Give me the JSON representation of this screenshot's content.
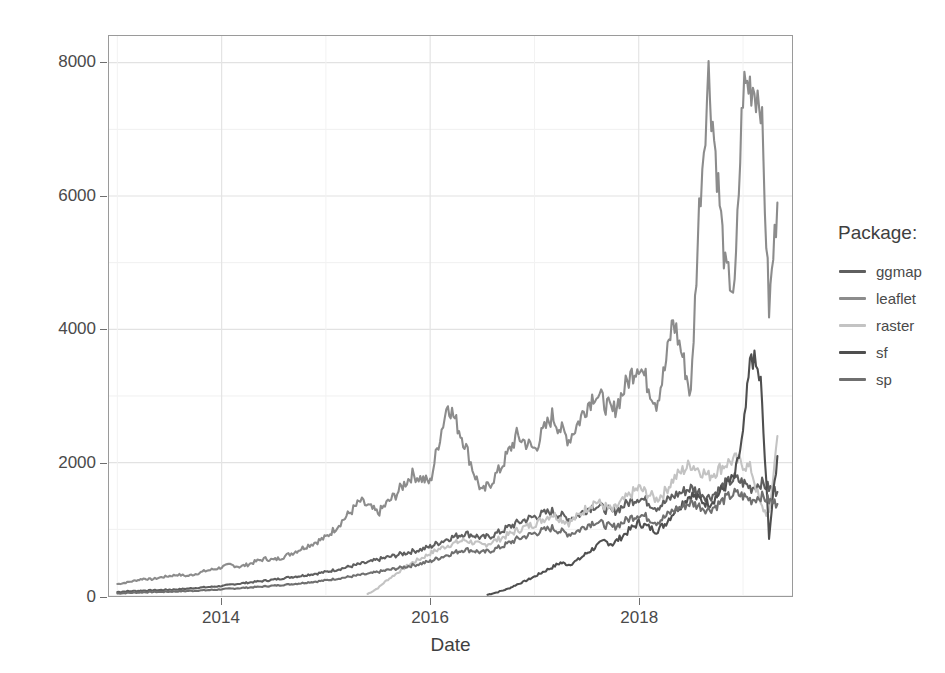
{
  "chart_data": {
    "type": "line",
    "title": "",
    "xlabel": "Date",
    "ylabel": "Downloads",
    "xlim": [
      2012.92,
      2019.47
    ],
    "ylim": [
      0,
      8400
    ],
    "yticks": [
      0,
      2000,
      4000,
      6000,
      8000
    ],
    "ytick_labels": [
      "0",
      "2000",
      "4000",
      "6000",
      "8000"
    ],
    "xticks": [
      2014,
      2016,
      2018
    ],
    "xtick_labels": [
      "2014",
      "2016",
      "2018"
    ],
    "grid": "major and minor, light gray",
    "legend_position": "right",
    "legend_title": "Package:",
    "series": [
      {
        "name": "ggmap",
        "color": "#5f5f5f",
        "x": [
          2013.0,
          2013.08,
          2013.17,
          2013.25,
          2013.33,
          2013.42,
          2013.5,
          2013.58,
          2013.67,
          2013.75,
          2013.83,
          2013.92,
          2014.0,
          2014.08,
          2014.17,
          2014.25,
          2014.33,
          2014.42,
          2014.5,
          2014.58,
          2014.67,
          2014.75,
          2014.83,
          2014.92,
          2015.0,
          2015.08,
          2015.17,
          2015.25,
          2015.33,
          2015.42,
          2015.5,
          2015.58,
          2015.67,
          2015.75,
          2015.83,
          2015.92,
          2016.0,
          2016.08,
          2016.17,
          2016.25,
          2016.33,
          2016.42,
          2016.5,
          2016.58,
          2016.67,
          2016.75,
          2016.83,
          2016.92,
          2017.0,
          2017.08,
          2017.17,
          2017.25,
          2017.33,
          2017.42,
          2017.5,
          2017.58,
          2017.67,
          2017.75,
          2017.83,
          2017.92,
          2018.0,
          2018.08,
          2018.17,
          2018.25,
          2018.33,
          2018.42,
          2018.5,
          2018.58,
          2018.67,
          2018.75,
          2018.83,
          2018.92,
          2019.0,
          2019.08,
          2019.17,
          2019.25,
          2019.33
        ],
        "y": [
          60,
          70,
          75,
          80,
          85,
          90,
          95,
          100,
          110,
          120,
          130,
          140,
          150,
          170,
          185,
          200,
          215,
          230,
          245,
          265,
          285,
          300,
          320,
          340,
          360,
          390,
          420,
          450,
          480,
          510,
          545,
          575,
          610,
          640,
          670,
          700,
          740,
          800,
          860,
          900,
          940,
          910,
          870,
          900,
          960,
          1030,
          1090,
          1150,
          1190,
          1230,
          1270,
          1210,
          1160,
          1210,
          1300,
          1360,
          1310,
          1260,
          1330,
          1420,
          1480,
          1420,
          1330,
          1400,
          1500,
          1560,
          1620,
          1560,
          1480,
          1560,
          1680,
          1760,
          1700,
          1620,
          1700,
          1620,
          1560
        ]
      },
      {
        "name": "leaflet",
        "color": "#8c8c8c",
        "x": [
          2013.0,
          2013.08,
          2013.17,
          2013.25,
          2013.33,
          2013.42,
          2013.5,
          2013.58,
          2013.67,
          2013.75,
          2013.83,
          2013.92,
          2014.0,
          2014.08,
          2014.17,
          2014.25,
          2014.33,
          2014.42,
          2014.5,
          2014.58,
          2014.67,
          2014.75,
          2014.83,
          2014.92,
          2015.0,
          2015.08,
          2015.17,
          2015.25,
          2015.33,
          2015.42,
          2015.5,
          2015.58,
          2015.67,
          2015.75,
          2015.83,
          2015.92,
          2016.0,
          2016.08,
          2016.17,
          2016.25,
          2016.33,
          2016.42,
          2016.5,
          2016.58,
          2016.67,
          2016.75,
          2016.83,
          2016.92,
          2017.0,
          2017.08,
          2017.17,
          2017.25,
          2017.33,
          2017.42,
          2017.5,
          2017.58,
          2017.67,
          2017.75,
          2017.83,
          2017.92,
          2018.0,
          2018.08,
          2018.17,
          2018.25,
          2018.33,
          2018.42,
          2018.5,
          2018.58,
          2018.67,
          2018.75,
          2018.83,
          2018.92,
          2019.0,
          2019.08,
          2019.17,
          2019.25,
          2019.33
        ],
        "y": [
          180,
          200,
          230,
          260,
          250,
          280,
          300,
          320,
          300,
          330,
          370,
          400,
          430,
          470,
          440,
          470,
          520,
          560,
          540,
          580,
          640,
          700,
          760,
          820,
          880,
          1000,
          1150,
          1280,
          1420,
          1330,
          1240,
          1380,
          1520,
          1680,
          1820,
          1760,
          1700,
          2300,
          2900,
          2600,
          2300,
          1850,
          1550,
          1700,
          1900,
          2150,
          2400,
          2300,
          2200,
          2450,
          2700,
          2500,
          2350,
          2600,
          2850,
          3050,
          2900,
          2750,
          3000,
          3300,
          3500,
          3200,
          2900,
          3400,
          4150,
          3600,
          3000,
          5800,
          7830,
          6400,
          4900,
          4550,
          7600,
          7700,
          7500,
          4300,
          5900
        ]
      },
      {
        "name": "raster",
        "color": "#c3c3c3",
        "x": [
          2015.4,
          2015.5,
          2015.58,
          2015.67,
          2015.75,
          2015.83,
          2015.92,
          2016.0,
          2016.08,
          2016.17,
          2016.25,
          2016.33,
          2016.42,
          2016.5,
          2016.58,
          2016.67,
          2016.75,
          2016.83,
          2016.92,
          2017.0,
          2017.08,
          2017.17,
          2017.25,
          2017.33,
          2017.42,
          2017.5,
          2017.58,
          2017.67,
          2017.75,
          2017.83,
          2017.92,
          2018.0,
          2018.08,
          2018.17,
          2018.25,
          2018.33,
          2018.42,
          2018.5,
          2018.58,
          2018.67,
          2018.75,
          2018.83,
          2018.92,
          2019.0,
          2019.08,
          2019.17,
          2019.25,
          2019.33
        ],
        "y": [
          30,
          120,
          230,
          330,
          420,
          500,
          570,
          640,
          700,
          760,
          800,
          840,
          800,
          760,
          800,
          860,
          920,
          980,
          1040,
          1080,
          1150,
          1230,
          1160,
          1100,
          1200,
          1320,
          1420,
          1350,
          1280,
          1400,
          1520,
          1620,
          1540,
          1450,
          1560,
          1750,
          1880,
          1980,
          1900,
          1800,
          1880,
          1980,
          2050,
          1980,
          1900,
          1350,
          1200,
          2400
        ]
      },
      {
        "name": "sf",
        "color": "#4f4f4f",
        "x": [
          2016.55,
          2016.65,
          2016.75,
          2016.83,
          2016.92,
          2017.0,
          2017.08,
          2017.17,
          2017.25,
          2017.33,
          2017.42,
          2017.5,
          2017.58,
          2017.67,
          2017.75,
          2017.83,
          2017.92,
          2018.0,
          2018.08,
          2018.17,
          2018.25,
          2018.33,
          2018.42,
          2018.5,
          2018.58,
          2018.67,
          2018.75,
          2018.83,
          2018.92,
          2019.0,
          2019.08,
          2019.17,
          2019.25,
          2019.33
        ],
        "y": [
          20,
          60,
          110,
          170,
          230,
          290,
          360,
          430,
          500,
          470,
          540,
          640,
          730,
          820,
          780,
          880,
          1000,
          1100,
          1040,
          980,
          1080,
          1250,
          1400,
          1520,
          1450,
          1380,
          1500,
          1650,
          1780,
          2400,
          3650,
          3200,
          900,
          2100
        ]
      },
      {
        "name": "sp",
        "color": "#6f6f6f",
        "x": [
          2013.0,
          2013.08,
          2013.17,
          2013.25,
          2013.33,
          2013.42,
          2013.5,
          2013.58,
          2013.67,
          2013.75,
          2013.83,
          2013.92,
          2014.0,
          2014.08,
          2014.17,
          2014.25,
          2014.33,
          2014.42,
          2014.5,
          2014.58,
          2014.67,
          2014.75,
          2014.83,
          2014.92,
          2015.0,
          2015.08,
          2015.17,
          2015.25,
          2015.33,
          2015.42,
          2015.5,
          2015.58,
          2015.67,
          2015.75,
          2015.83,
          2015.92,
          2016.0,
          2016.08,
          2016.17,
          2016.25,
          2016.33,
          2016.42,
          2016.5,
          2016.58,
          2016.67,
          2016.75,
          2016.83,
          2016.92,
          2017.0,
          2017.08,
          2017.17,
          2017.25,
          2017.33,
          2017.42,
          2017.5,
          2017.58,
          2017.67,
          2017.75,
          2017.83,
          2017.92,
          2018.0,
          2018.08,
          2018.17,
          2018.25,
          2018.33,
          2018.42,
          2018.5,
          2018.58,
          2018.67,
          2018.75,
          2018.83,
          2018.92,
          2019.0,
          2019.08,
          2019.17,
          2019.25,
          2019.33
        ],
        "y": [
          40,
          45,
          50,
          55,
          60,
          62,
          65,
          70,
          75,
          80,
          85,
          92,
          100,
          110,
          118,
          126,
          135,
          145,
          155,
          165,
          178,
          190,
          205,
          220,
          235,
          255,
          275,
          295,
          315,
          335,
          360,
          385,
          410,
          435,
          460,
          490,
          520,
          570,
          620,
          660,
          700,
          680,
          650,
          680,
          730,
          790,
          850,
          900,
          940,
          980,
          1020,
          970,
          930,
          980,
          1060,
          1120,
          1070,
          1030,
          1090,
          1170,
          1230,
          1180,
          1110,
          1180,
          1280,
          1340,
          1400,
          1350,
          1290,
          1360,
          1460,
          1540,
          1500,
          1440,
          1500,
          1430,
          1380
        ]
      }
    ]
  },
  "axes": {
    "y_title": "Downloads",
    "x_title": "Date"
  },
  "legend": {
    "title": "Package:",
    "items": [
      {
        "label": "ggmap",
        "color": "#5f5f5f"
      },
      {
        "label": "leaflet",
        "color": "#8c8c8c"
      },
      {
        "label": "raster",
        "color": "#c3c3c3"
      },
      {
        "label": "sf",
        "color": "#4f4f4f"
      },
      {
        "label": "sp",
        "color": "#6f6f6f"
      }
    ]
  }
}
